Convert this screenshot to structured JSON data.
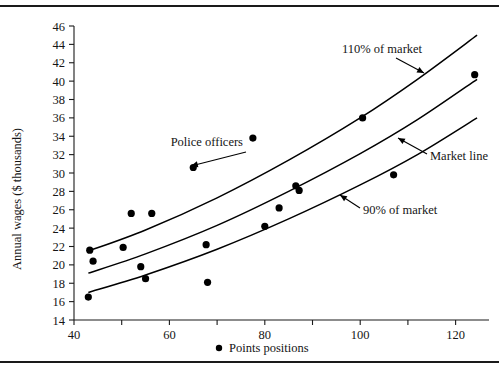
{
  "figure": {
    "rule_top_label": "top-horizontal-rule",
    "rule_bottom_label": "bottom-horizontal-rule"
  },
  "chart_data": {
    "type": "scatter",
    "title": "",
    "xlabel": "Points positions",
    "ylabel": "Annual wages ($ thousands)",
    "xlim": [
      40,
      127
    ],
    "ylim": [
      14,
      46
    ],
    "xticks": [
      40,
      60,
      80,
      100,
      120
    ],
    "xtick_labels": [
      "40",
      "60",
      "80",
      "100",
      "120"
    ],
    "xminor_ticks": [
      50,
      70,
      90,
      110
    ],
    "yticks": [
      14,
      16,
      18,
      20,
      22,
      24,
      26,
      28,
      30,
      32,
      34,
      36,
      38,
      40,
      42,
      44,
      46
    ],
    "ytick_labels": [
      "14",
      "16",
      "18",
      "20",
      "22",
      "24",
      "26",
      "28",
      "30",
      "32",
      "34",
      "36",
      "38",
      "40",
      "42",
      "44",
      "46"
    ],
    "grid": false,
    "legend_position": "below-axis",
    "legend": [
      {
        "marker": "filled-circle",
        "label": "Points positions"
      }
    ],
    "points": [
      {
        "x": 43.0,
        "y": 16.5
      },
      {
        "x": 43.3,
        "y": 21.6
      },
      {
        "x": 44.0,
        "y": 20.4
      },
      {
        "x": 50.3,
        "y": 21.9
      },
      {
        "x": 52.0,
        "y": 25.6
      },
      {
        "x": 54.0,
        "y": 19.8
      },
      {
        "x": 55.0,
        "y": 18.5
      },
      {
        "x": 56.3,
        "y": 25.6
      },
      {
        "x": 65.0,
        "y": 30.6
      },
      {
        "x": 67.7,
        "y": 22.2
      },
      {
        "x": 68.0,
        "y": 18.1
      },
      {
        "x": 77.5,
        "y": 33.8
      },
      {
        "x": 80.0,
        "y": 24.2
      },
      {
        "x": 83.0,
        "y": 26.2
      },
      {
        "x": 86.5,
        "y": 28.6
      },
      {
        "x": 87.2,
        "y": 28.1
      },
      {
        "x": 100.5,
        "y": 36.0
      },
      {
        "x": 107.0,
        "y": 29.8
      },
      {
        "x": 124.0,
        "y": 40.7
      }
    ],
    "series": [
      {
        "name": "110% of market",
        "type": "curve",
        "points": [
          {
            "x": 43.0,
            "y": 21.5
          },
          {
            "x": 55.0,
            "y": 23.8
          },
          {
            "x": 70.0,
            "y": 27.3
          },
          {
            "x": 85.0,
            "y": 31.4
          },
          {
            "x": 100.0,
            "y": 36.0
          },
          {
            "x": 112.0,
            "y": 40.2
          },
          {
            "x": 124.5,
            "y": 45.0
          }
        ]
      },
      {
        "name": "Market line",
        "type": "curve",
        "points": [
          {
            "x": 43.0,
            "y": 19.1
          },
          {
            "x": 55.0,
            "y": 21.2
          },
          {
            "x": 70.0,
            "y": 24.3
          },
          {
            "x": 85.0,
            "y": 28.0
          },
          {
            "x": 100.0,
            "y": 32.1
          },
          {
            "x": 112.0,
            "y": 35.8
          },
          {
            "x": 124.5,
            "y": 40.2
          }
        ]
      },
      {
        "name": "90% of market",
        "type": "curve",
        "points": [
          {
            "x": 43.0,
            "y": 17.0
          },
          {
            "x": 55.0,
            "y": 18.9
          },
          {
            "x": 70.0,
            "y": 21.7
          },
          {
            "x": 85.0,
            "y": 25.0
          },
          {
            "x": 100.0,
            "y": 28.7
          },
          {
            "x": 112.0,
            "y": 32.0
          },
          {
            "x": 124.5,
            "y": 36.0
          }
        ]
      }
    ],
    "annotations": [
      {
        "label": "Police officers",
        "target_x": 65.0,
        "target_y": 30.6
      },
      {
        "label": "110% of market",
        "target_x": 98.0,
        "target_y": 41.0
      },
      {
        "label": "Market line",
        "target_x": 104.0,
        "target_y": 33.5
      },
      {
        "label": "90% of market",
        "target_x": 99.0,
        "target_y": 26.2
      }
    ]
  }
}
